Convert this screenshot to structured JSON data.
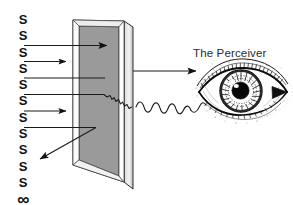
{
  "figure": {
    "title": "",
    "background_color": "#ffffff",
    "ink_color": "#111111",
    "panel_fill_color": "#9a9a9a",
    "panel_frame_color": "#ffffff",
    "panel_edge_color": "#3a3a3a"
  },
  "stimuli": {
    "label_repeat": "S",
    "infinity_symbol": "∞",
    "items": [
      {
        "label": "S",
        "has_ray": false
      },
      {
        "label": "S",
        "has_ray": false
      },
      {
        "label": "S",
        "has_ray": true
      },
      {
        "label": "S",
        "has_ray": true
      },
      {
        "label": "S",
        "has_ray": true
      },
      {
        "label": "S",
        "has_ray": true
      },
      {
        "label": "S",
        "has_ray": true
      },
      {
        "label": "S",
        "has_ray": true
      },
      {
        "label": "S",
        "has_ray": false
      },
      {
        "label": "S",
        "has_ray": false
      },
      {
        "label": "S",
        "has_ray": false
      },
      {
        "label": "∞",
        "has_ray": false
      }
    ]
  },
  "perceiver": {
    "label": "The Perceiver",
    "icon": "eye-illustration"
  },
  "elements": {
    "panel_name": "transparent-panel",
    "incoming_rays_name": "incoming-stimulus-rays",
    "reflected_ray_name": "reflected-ray",
    "transmitted_ray_name": "transmitted-ray-to-eye",
    "wavy_line_name": "distorted-wave-line"
  }
}
